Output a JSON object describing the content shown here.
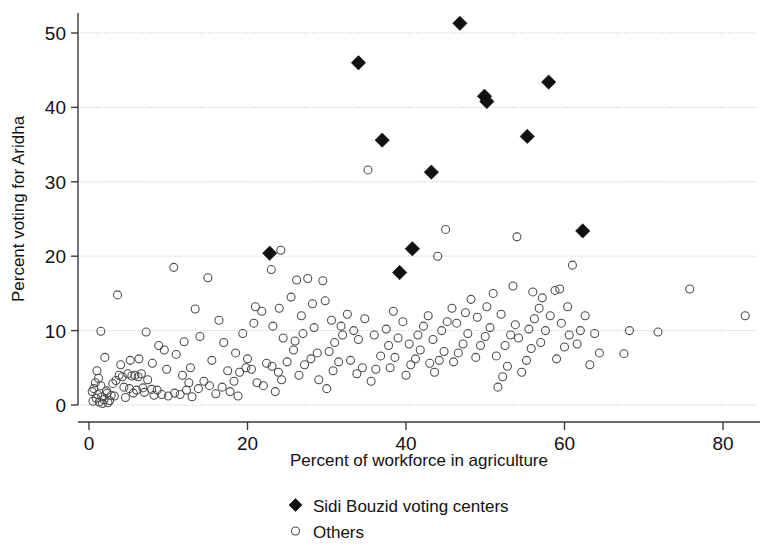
{
  "chart_data": {
    "type": "scatter",
    "title": "",
    "xlabel": "Percent of workforce in agriculture",
    "ylabel": "Percent voting for Aridha",
    "xlim": [
      -2,
      86
    ],
    "ylim": [
      -1.5,
      52.5
    ],
    "xticks": [
      0,
      20,
      40,
      60,
      80
    ],
    "yticks": [
      0,
      10,
      20,
      30,
      40,
      50
    ],
    "xticklabels": [
      "0",
      "20",
      "40",
      "60",
      "80"
    ],
    "yticklabels": [
      "0",
      "10",
      "20",
      "30",
      "40",
      "50"
    ],
    "grid": "horizontal-dotted",
    "legend_position": "below-axis-center",
    "series": [
      {
        "name": "Sidi Bouzid voting centers",
        "marker": "filled-diamond",
        "color": "#111111",
        "points": [
          [
            46.8,
            51.3
          ],
          [
            34.0,
            46.0
          ],
          [
            58.0,
            43.4
          ],
          [
            49.9,
            41.5
          ],
          [
            50.2,
            40.8
          ],
          [
            55.3,
            36.1
          ],
          [
            37.0,
            35.6
          ],
          [
            43.2,
            31.3
          ],
          [
            62.3,
            23.4
          ],
          [
            40.8,
            21.0
          ],
          [
            22.8,
            20.4
          ],
          [
            39.2,
            17.8
          ]
        ]
      },
      {
        "name": "Others",
        "marker": "open-circle",
        "color": "#4a4a4a",
        "points": [
          [
            3.6,
            14.8
          ],
          [
            10.7,
            18.5
          ],
          [
            1.5,
            9.9
          ],
          [
            2.0,
            6.4
          ],
          [
            1.0,
            4.6
          ],
          [
            1.2,
            3.6
          ],
          [
            0.8,
            3.0
          ],
          [
            1.5,
            2.6
          ],
          [
            0.6,
            2.2
          ],
          [
            2.2,
            1.9
          ],
          [
            1.1,
            1.4
          ],
          [
            1.6,
            1.1
          ],
          [
            0.9,
            0.9
          ],
          [
            1.9,
            0.7
          ],
          [
            2.6,
            0.6
          ],
          [
            0.5,
            0.5
          ],
          [
            1.3,
            0.4
          ],
          [
            2.3,
            1.6
          ],
          [
            3.0,
            2.9
          ],
          [
            3.4,
            3.3
          ],
          [
            2.8,
            1.3
          ],
          [
            3.8,
            4.0
          ],
          [
            4.2,
            3.8
          ],
          [
            4.9,
            4.2
          ],
          [
            5.4,
            3.9
          ],
          [
            5.8,
            4.0
          ],
          [
            6.2,
            3.8
          ],
          [
            6.6,
            4.2
          ],
          [
            4.4,
            2.4
          ],
          [
            5.1,
            2.2
          ],
          [
            6.0,
            2.0
          ],
          [
            6.8,
            2.3
          ],
          [
            7.4,
            3.4
          ],
          [
            7.9,
            2.1
          ],
          [
            8.6,
            2.0
          ],
          [
            8.0,
            5.6
          ],
          [
            6.3,
            6.2
          ],
          [
            5.2,
            6.0
          ],
          [
            4.0,
            5.4
          ],
          [
            9.2,
            1.4
          ],
          [
            10.0,
            1.2
          ],
          [
            10.8,
            1.6
          ],
          [
            11.5,
            1.4
          ],
          [
            12.3,
            2.0
          ],
          [
            13.0,
            1.1
          ],
          [
            13.8,
            2.2
          ],
          [
            9.5,
            7.4
          ],
          [
            8.8,
            8.0
          ],
          [
            11.0,
            6.8
          ],
          [
            12.0,
            8.5
          ],
          [
            12.8,
            5.0
          ],
          [
            14.5,
            3.2
          ],
          [
            15.2,
            2.6
          ],
          [
            16.0,
            1.5
          ],
          [
            16.8,
            2.4
          ],
          [
            15.5,
            6.0
          ],
          [
            14.0,
            9.2
          ],
          [
            13.4,
            12.9
          ],
          [
            15.0,
            17.1
          ],
          [
            17.5,
            4.6
          ],
          [
            18.3,
            3.2
          ],
          [
            19.0,
            4.4
          ],
          [
            19.8,
            5.0
          ],
          [
            20.5,
            4.8
          ],
          [
            21.2,
            3.0
          ],
          [
            20.0,
            6.2
          ],
          [
            18.5,
            7.0
          ],
          [
            17.0,
            8.4
          ],
          [
            19.4,
            9.6
          ],
          [
            20.8,
            11.0
          ],
          [
            21.8,
            12.6
          ],
          [
            22.4,
            5.6
          ],
          [
            23.1,
            5.2
          ],
          [
            23.9,
            4.4
          ],
          [
            22.0,
            2.6
          ],
          [
            23.5,
            1.8
          ],
          [
            24.3,
            3.4
          ],
          [
            25.0,
            5.8
          ],
          [
            25.8,
            7.4
          ],
          [
            24.5,
            9.0
          ],
          [
            23.2,
            10.6
          ],
          [
            24.0,
            13.0
          ],
          [
            25.5,
            14.5
          ],
          [
            24.2,
            20.8
          ],
          [
            23.0,
            18.2
          ],
          [
            26.5,
            4.0
          ],
          [
            27.2,
            5.4
          ],
          [
            28.0,
            6.2
          ],
          [
            28.8,
            7.0
          ],
          [
            26.0,
            8.6
          ],
          [
            27.0,
            9.6
          ],
          [
            28.4,
            10.4
          ],
          [
            26.8,
            12.0
          ],
          [
            28.2,
            13.6
          ],
          [
            29.5,
            16.7
          ],
          [
            29.0,
            3.4
          ],
          [
            30.0,
            2.2
          ],
          [
            30.8,
            4.6
          ],
          [
            31.5,
            5.8
          ],
          [
            30.3,
            7.2
          ],
          [
            31.0,
            8.4
          ],
          [
            32.0,
            9.4
          ],
          [
            31.8,
            10.6
          ],
          [
            30.6,
            11.4
          ],
          [
            32.6,
            12.2
          ],
          [
            33.0,
            6.0
          ],
          [
            33.8,
            4.2
          ],
          [
            34.5,
            5.0
          ],
          [
            34.0,
            8.8
          ],
          [
            33.4,
            10.0
          ],
          [
            34.8,
            11.6
          ],
          [
            35.2,
            31.6
          ],
          [
            35.6,
            3.2
          ],
          [
            36.2,
            4.8
          ],
          [
            36.8,
            6.6
          ],
          [
            36.0,
            9.4
          ],
          [
            37.5,
            10.2
          ],
          [
            38.0,
            5.0
          ],
          [
            38.6,
            6.4
          ],
          [
            37.8,
            8.0
          ],
          [
            39.0,
            9.0
          ],
          [
            39.6,
            11.2
          ],
          [
            38.4,
            12.6
          ],
          [
            40.0,
            4.0
          ],
          [
            40.6,
            5.4
          ],
          [
            41.2,
            6.2
          ],
          [
            41.8,
            7.4
          ],
          [
            40.4,
            8.2
          ],
          [
            41.5,
            9.4
          ],
          [
            42.2,
            10.6
          ],
          [
            42.8,
            12.0
          ],
          [
            43.0,
            5.6
          ],
          [
            43.6,
            4.4
          ],
          [
            44.2,
            6.0
          ],
          [
            44.8,
            7.2
          ],
          [
            43.4,
            8.8
          ],
          [
            44.5,
            10.0
          ],
          [
            45.2,
            11.2
          ],
          [
            45.8,
            13.0
          ],
          [
            44.0,
            20.0
          ],
          [
            45.0,
            23.6
          ],
          [
            46.0,
            5.8
          ],
          [
            46.6,
            7.0
          ],
          [
            47.2,
            8.2
          ],
          [
            47.8,
            9.6
          ],
          [
            46.4,
            11.0
          ],
          [
            47.5,
            12.4
          ],
          [
            48.2,
            14.2
          ],
          [
            48.8,
            6.4
          ],
          [
            49.4,
            8.0
          ],
          [
            50.0,
            9.2
          ],
          [
            50.6,
            10.4
          ],
          [
            49.0,
            11.8
          ],
          [
            50.2,
            13.2
          ],
          [
            51.0,
            15.0
          ],
          [
            51.6,
            2.4
          ],
          [
            52.2,
            3.8
          ],
          [
            52.8,
            5.2
          ],
          [
            51.4,
            6.6
          ],
          [
            52.5,
            8.0
          ],
          [
            53.2,
            9.4
          ],
          [
            53.8,
            10.8
          ],
          [
            52.0,
            12.2
          ],
          [
            53.5,
            16.0
          ],
          [
            54.0,
            22.6
          ],
          [
            54.6,
            4.4
          ],
          [
            55.2,
            6.0
          ],
          [
            55.8,
            7.6
          ],
          [
            54.2,
            9.0
          ],
          [
            55.5,
            10.2
          ],
          [
            56.2,
            11.6
          ],
          [
            56.8,
            13.0
          ],
          [
            56.0,
            15.2
          ],
          [
            57.0,
            8.4
          ],
          [
            57.6,
            10.0
          ],
          [
            58.2,
            12.0
          ],
          [
            57.2,
            14.4
          ],
          [
            58.8,
            15.4
          ],
          [
            59.4,
            15.6
          ],
          [
            59.0,
            6.2
          ],
          [
            60.0,
            7.8
          ],
          [
            60.6,
            9.4
          ],
          [
            59.6,
            11.0
          ],
          [
            60.4,
            13.2
          ],
          [
            61.0,
            18.8
          ],
          [
            61.6,
            8.2
          ],
          [
            62.0,
            10.0
          ],
          [
            62.6,
            12.0
          ],
          [
            63.2,
            5.4
          ],
          [
            63.8,
            9.6
          ],
          [
            64.4,
            7.0
          ],
          [
            67.5,
            6.9
          ],
          [
            68.2,
            10.0
          ],
          [
            71.8,
            9.8
          ],
          [
            75.8,
            15.6
          ],
          [
            82.8,
            12.0
          ],
          [
            29.8,
            14.0
          ],
          [
            26.2,
            16.8
          ],
          [
            21.0,
            13.2
          ],
          [
            27.6,
            17.0
          ],
          [
            16.4,
            11.4
          ],
          [
            7.2,
            9.8
          ],
          [
            9.8,
            4.8
          ],
          [
            11.8,
            4.0
          ],
          [
            12.6,
            3.0
          ],
          [
            17.8,
            1.8
          ],
          [
            18.8,
            1.2
          ],
          [
            4.6,
            1.0
          ],
          [
            3.2,
            1.2
          ],
          [
            2.4,
            0.3
          ],
          [
            1.7,
            0.2
          ],
          [
            0.4,
            1.8
          ],
          [
            5.6,
            1.6
          ],
          [
            7.0,
            1.7
          ],
          [
            8.2,
            1.3
          ]
        ]
      }
    ]
  },
  "legend": {
    "entries": [
      {
        "label": "Sidi Bouzid voting centers",
        "marker": "filled-diamond"
      },
      {
        "label": "Others",
        "marker": "open-circle"
      }
    ]
  }
}
